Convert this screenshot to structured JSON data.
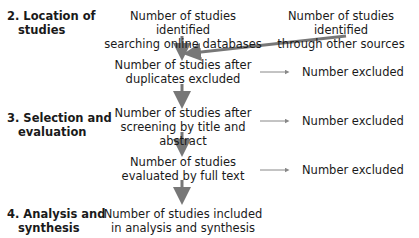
{
  "stages": [
    {
      "label_line1": "2. Location of",
      "label_line2": "studies"
    },
    {
      "label_line1": "3. Selection and",
      "label_line2": "evaluation"
    },
    {
      "label_line1": "4. Analysis and",
      "label_line2": "synthesis"
    }
  ],
  "boxes": {
    "online": {
      "line1": "Number of studies identified",
      "line2": "searching online databases"
    },
    "other": {
      "line1": "Number of studies identified",
      "line2": "through other sources"
    },
    "dedup": {
      "line1": "Number of studies after",
      "line2": "duplicates excluded"
    },
    "screen": {
      "line1": "Number of studies after",
      "line2": "screening by title and abstract"
    },
    "fulltext": {
      "line1": "Number of studies",
      "line2": "evaluated by full text"
    },
    "included": {
      "line1": "Number of studies included",
      "line2": "in analysis and synthesis"
    }
  },
  "excluded": [
    {
      "label": "Number excluded"
    },
    {
      "label": "Number excluded"
    },
    {
      "label": "Number excluded"
    }
  ],
  "colors": {
    "arrow": "#777777",
    "text": "#1a1a1a"
  }
}
